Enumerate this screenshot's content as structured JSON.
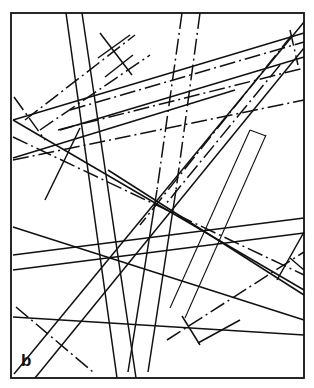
{
  "figure": {
    "panel_label": "b",
    "stroke_color": "#111111",
    "background": "#ffffff",
    "frame": {
      "x": 11,
      "y": 13,
      "width": 293,
      "height": 365
    },
    "lines": [
      {
        "id": "v-solid-1",
        "style": "solid",
        "x1": 66,
        "y1": 13,
        "x2": 117,
        "y2": 378
      },
      {
        "id": "v-solid-2",
        "style": "solid",
        "x1": 82,
        "y1": 13,
        "x2": 136,
        "y2": 378
      },
      {
        "id": "v-dashdot-1",
        "style": "dashdot",
        "x1": 182,
        "y1": 13,
        "x2": 157,
        "y2": 190
      },
      {
        "id": "v-dashdot-2",
        "style": "dashdot",
        "x1": 200,
        "y1": 13,
        "x2": 176,
        "y2": 190
      },
      {
        "id": "v-solid-3",
        "style": "solid",
        "x1": 157,
        "y1": 190,
        "x2": 128,
        "y2": 372
      },
      {
        "id": "v-solid-4",
        "style": "solid",
        "x1": 176,
        "y1": 190,
        "x2": 148,
        "y2": 372
      },
      {
        "id": "diag-solid-big-1",
        "style": "solid",
        "x1": 304,
        "y1": 22,
        "x2": 14,
        "y2": 374
      },
      {
        "id": "diag-solid-big-2",
        "style": "solid",
        "x1": 304,
        "y1": 48,
        "x2": 35,
        "y2": 378
      },
      {
        "id": "diag-dashdot-big-1",
        "style": "dashdot",
        "x1": 292,
        "y1": 35,
        "x2": 140,
        "y2": 225
      },
      {
        "id": "diag-dashdot-big-2",
        "style": "dashdot",
        "x1": 280,
        "y1": 65,
        "x2": 165,
        "y2": 205
      },
      {
        "id": "upper-band-solid-1",
        "style": "solid",
        "x1": 13,
        "y1": 120,
        "x2": 304,
        "y2": 33
      },
      {
        "id": "upper-band-dashdot-1",
        "style": "dashdot",
        "x1": 70,
        "y1": 110,
        "x2": 304,
        "y2": 42
      },
      {
        "id": "upper-band-solid-2",
        "style": "solid",
        "x1": 60,
        "y1": 130,
        "x2": 304,
        "y2": 57
      },
      {
        "id": "upper-band-dashdot-2",
        "style": "dashdot",
        "x1": 58,
        "y1": 130,
        "x2": 304,
        "y2": 68
      },
      {
        "id": "mid-band-solid-1",
        "style": "solid",
        "x1": 13,
        "y1": 158,
        "x2": 235,
        "y2": 90
      },
      {
        "id": "mid-band-dashdot-1",
        "style": "dashdot",
        "x1": 13,
        "y1": 160,
        "x2": 304,
        "y2": 100
      },
      {
        "id": "left-dashdot-up",
        "style": "dashdot",
        "x1": 25,
        "y1": 120,
        "x2": 135,
        "y2": 35
      },
      {
        "id": "left-dashdot-up-2",
        "style": "dashdot",
        "x1": 40,
        "y1": 130,
        "x2": 150,
        "y2": 55
      },
      {
        "id": "hash-a",
        "style": "solid",
        "x1": 100,
        "y1": 33,
        "x2": 132,
        "y2": 75
      },
      {
        "id": "hash-b",
        "style": "solid",
        "x1": 98,
        "y1": 58,
        "x2": 130,
        "y2": 35
      },
      {
        "id": "hash-c",
        "style": "solid",
        "x1": 105,
        "y1": 77,
        "x2": 133,
        "y2": 55
      },
      {
        "id": "left-short-diag",
        "style": "dashdot",
        "x1": 14,
        "y1": 97,
        "x2": 45,
        "y2": 140
      },
      {
        "id": "cross-down-1",
        "style": "solid",
        "x1": 13,
        "y1": 120,
        "x2": 304,
        "y2": 290
      },
      {
        "id": "cross-down-2",
        "style": "dashdot",
        "x1": 13,
        "y1": 137,
        "x2": 304,
        "y2": 275
      },
      {
        "id": "cross-down-3",
        "style": "solid",
        "x1": 108,
        "y1": 170,
        "x2": 304,
        "y2": 295
      },
      {
        "id": "left-mid-thin",
        "style": "solid",
        "x1": 80,
        "y1": 128,
        "x2": 45,
        "y2": 200
      },
      {
        "id": "low-cross-1",
        "style": "solid",
        "x1": 13,
        "y1": 227,
        "x2": 304,
        "y2": 320
      },
      {
        "id": "h-solid-1",
        "style": "solid",
        "x1": 13,
        "y1": 255,
        "x2": 304,
        "y2": 218
      },
      {
        "id": "h-solid-2",
        "style": "solid",
        "x1": 13,
        "y1": 270,
        "x2": 304,
        "y2": 233
      },
      {
        "id": "h-solid-3",
        "style": "solid",
        "x1": 13,
        "y1": 317,
        "x2": 304,
        "y2": 335
      },
      {
        "id": "thin-pair-1",
        "style": "thin",
        "x1": 250,
        "y1": 130,
        "x2": 170,
        "y2": 308
      },
      {
        "id": "thin-pair-2",
        "style": "thin",
        "x1": 266,
        "y1": 135,
        "x2": 185,
        "y2": 318
      },
      {
        "id": "thin-pair-cap",
        "style": "thin",
        "x1": 250,
        "y1": 130,
        "x2": 266,
        "y2": 136
      },
      {
        "id": "low-dash-left",
        "style": "dashdot",
        "x1": 16,
        "y1": 307,
        "x2": 93,
        "y2": 372
      },
      {
        "id": "low-right-dashdot",
        "style": "dashdot",
        "x1": 167,
        "y1": 340,
        "x2": 304,
        "y2": 252
      },
      {
        "id": "low-right-tick-1",
        "style": "solid",
        "x1": 182,
        "y1": 316,
        "x2": 200,
        "y2": 345
      },
      {
        "id": "low-right-tick-2",
        "style": "solid",
        "x1": 198,
        "y1": 343,
        "x2": 240,
        "y2": 320
      },
      {
        "id": "right-edge-cap",
        "style": "solid",
        "x1": 290,
        "y1": 258,
        "x2": 304,
        "y2": 270
      },
      {
        "id": "right-edge-tick",
        "style": "solid",
        "x1": 304,
        "y1": 232,
        "x2": 277,
        "y2": 280
      },
      {
        "id": "tr-cap-1",
        "style": "dashdot",
        "x1": 290,
        "y1": 30,
        "x2": 298,
        "y2": 65
      }
    ]
  }
}
